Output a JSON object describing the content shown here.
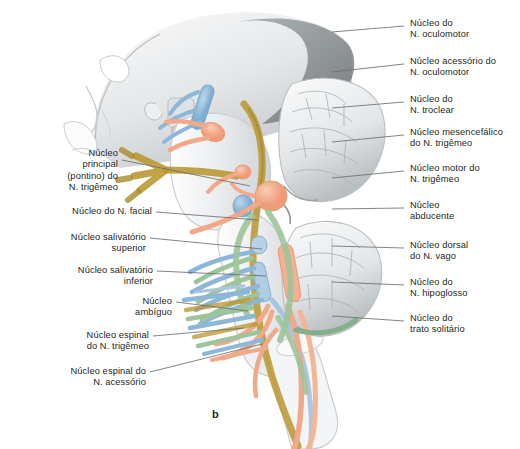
{
  "figure": {
    "panel_label": "b",
    "background_color": "#ffffff",
    "text_color": "#231f20",
    "leader_color": "#6d6e71"
  },
  "palette": {
    "somatic_motor_blue": "#8cb7d8",
    "branchial_motor_salmon": "#f2a98a",
    "visceral_motor_green": "#9dc49a",
    "sensory_olive": "#b8972f",
    "brainstem_grey": "#e9ebec",
    "skull_grey": "#cfd2d4",
    "cerebellum_grey": "#dcdfe1",
    "shadow_grey": "#8e9396"
  },
  "labels_right": [
    {
      "id": "oculomotor",
      "lines": "Núcleo do\nN. oculomotor",
      "x": 410,
      "y": 18,
      "leader": [
        [
          332,
          32
        ],
        [
          404,
          26
        ]
      ]
    },
    {
      "id": "accessory-oculomotor",
      "lines": "Núcleo acessório do\nN. oculomotor",
      "x": 410,
      "y": 56,
      "leader": [
        [
          332,
          72
        ],
        [
          404,
          64
        ]
      ]
    },
    {
      "id": "trochlear",
      "lines": "Núcleo do\nN. troclear",
      "x": 410,
      "y": 94,
      "leader": [
        [
          332,
          108
        ],
        [
          404,
          102
        ]
      ]
    },
    {
      "id": "mesencephalic-trigeminal",
      "lines": "Núcleo mesencefálico\ndo N. trigêmeo",
      "x": 410,
      "y": 127,
      "leader": [
        [
          332,
          142
        ],
        [
          404,
          135
        ]
      ]
    },
    {
      "id": "motor-trigeminal",
      "lines": "Núcleo motor do\nN. trigêmeo",
      "x": 410,
      "y": 163,
      "leader": [
        [
          332,
          178
        ],
        [
          404,
          171
        ]
      ]
    },
    {
      "id": "abducens",
      "lines": "Núcleo\nabducente",
      "x": 410,
      "y": 200,
      "leader": [
        [
          332,
          209
        ],
        [
          404,
          208
        ]
      ]
    },
    {
      "id": "dorsal-vagus",
      "lines": "Núcleo dorsal\ndo N. vago",
      "x": 410,
      "y": 240,
      "leader": [
        [
          332,
          246
        ],
        [
          404,
          248
        ]
      ]
    },
    {
      "id": "hypoglossal",
      "lines": "Núcleo do\nN. hipoglosso",
      "x": 410,
      "y": 277,
      "leader": [
        [
          332,
          282
        ],
        [
          404,
          285
        ]
      ]
    },
    {
      "id": "solitary-tract",
      "lines": "Núcleo do\ntrato solitário",
      "x": 410,
      "y": 313,
      "leader": [
        [
          332,
          316
        ],
        [
          404,
          321
        ]
      ]
    }
  ],
  "labels_left": [
    {
      "id": "principal-pontine-trigeminal",
      "lines": "Núcleo\nprincipal\n(pontino) do\nN. trigêmeo",
      "x": 118,
      "y": 148,
      "leader": [
        [
          122,
          160
        ],
        [
          250,
          186
        ]
      ]
    },
    {
      "id": "facial",
      "lines": "Núcleo do N. facial",
      "x": 152,
      "y": 206,
      "leader": [
        [
          156,
          212
        ],
        [
          258,
          220
        ]
      ]
    },
    {
      "id": "superior-salivatory",
      "lines": "Núcleo salivatório\nsuperior",
      "x": 146,
      "y": 232,
      "leader": [
        [
          150,
          238
        ],
        [
          262,
          249
        ]
      ]
    },
    {
      "id": "inferior-salivatory",
      "lines": "Núcleo salivatório\ninferior",
      "x": 153,
      "y": 265,
      "leader": [
        [
          157,
          271
        ],
        [
          266,
          276
        ]
      ]
    },
    {
      "id": "ambiguus",
      "lines": "Núcleo\nambíguo",
      "x": 172,
      "y": 296,
      "leader": [
        [
          176,
          302
        ],
        [
          248,
          311
        ]
      ]
    },
    {
      "id": "spinal-trigeminal",
      "lines": "Núcleo espinal\ndo N. trigêmeo",
      "x": 149,
      "y": 330,
      "leader": [
        [
          153,
          336
        ],
        [
          244,
          328
        ]
      ]
    },
    {
      "id": "spinal-accessory",
      "lines": "Núcleo espinal do\nN. acessório",
      "x": 146,
      "y": 366,
      "leader": [
        [
          150,
          372
        ],
        [
          262,
          344
        ]
      ]
    }
  ]
}
